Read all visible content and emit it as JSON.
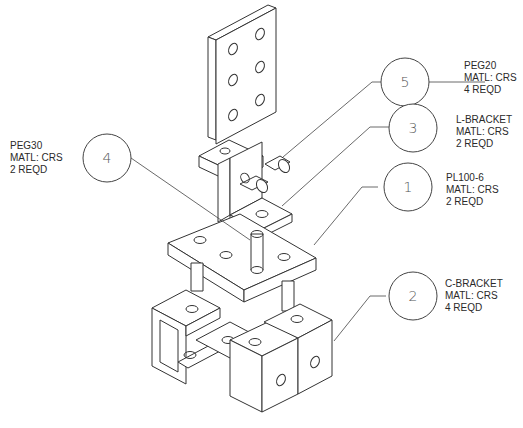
{
  "callouts": [
    {
      "balloon": "5",
      "part": "PEG20",
      "material": "MATL: CRS",
      "quantity": "4 REQD"
    },
    {
      "balloon": "3",
      "part": "L-BRACKET",
      "material": "MATL: CRS",
      "quantity": "2 REQD"
    },
    {
      "balloon": "1",
      "part": "PL100-6",
      "material": "MATL: CRS",
      "quantity": "2 REQD"
    },
    {
      "balloon": "4",
      "part": "PEG30",
      "material": "MATL: CRS",
      "quantity": "2 REQD"
    },
    {
      "balloon": "2",
      "part": "C-BRACKET",
      "material": "MATL: CRS",
      "quantity": "4 REQD"
    }
  ]
}
